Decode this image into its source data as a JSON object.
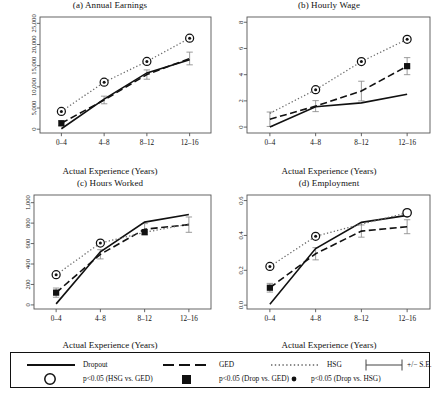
{
  "figure": {
    "xlabel": "Actual Experience (Years)",
    "xticks": [
      "0–4",
      "4–8",
      "8–12",
      "12–16"
    ]
  },
  "legend": {
    "dropout_label": "Dropout",
    "ged_label": "GED",
    "hsg_label": "HSG",
    "se_label": "+/− S.E.",
    "sig_hsg_ged": "p<0.05 (HSG vs. GED)",
    "sig_drop_ged": "p<0.05 (Drop vs. GED)",
    "sig_drop_hsg": "p<0.05 (Drop vs. HSG)",
    "keys": {
      "dropout": "solid-line-key",
      "ged": "dashed-line-key",
      "hsg": "dotted-line-key",
      "se": "errorbar-key",
      "open_circle": "open-circle-marker",
      "filled_square": "filled-square-marker",
      "small_dot": "small-dot-marker"
    }
  },
  "colors": {
    "line": "#111111",
    "axis": "#555555",
    "errorbar": "#777777",
    "background": "#ffffff"
  },
  "chart_data": [
    {
      "type": "line",
      "panel": "a",
      "title": "(a) Annual Earnings",
      "xlabel": "Actual Experience (Years)",
      "ylabel": "",
      "categories": [
        "0–4",
        "4–8",
        "8–12",
        "12–16"
      ],
      "yticks": [
        0,
        5000,
        10000,
        15000,
        20000,
        25000
      ],
      "yticklabels": [
        "0",
        "5,000",
        "10,000",
        "15,000",
        "20,000",
        "25,000"
      ],
      "ylim": [
        -900,
        26500
      ],
      "grid": false,
      "legend_position": "below-figure",
      "series": [
        {
          "name": "Dropout",
          "style": "solid",
          "values": [
            100,
            7100,
            13300,
            16400
          ],
          "errors": [
            0,
            0,
            0,
            0
          ]
        },
        {
          "name": "GED",
          "style": "dashed",
          "values": [
            1400,
            6900,
            12900,
            16700
          ],
          "errors": [
            600,
            900,
            1100,
            1500
          ]
        },
        {
          "name": "HSG",
          "style": "dotted",
          "values": [
            4200,
            11100,
            16000,
            21500
          ],
          "errors": [
            0,
            0,
            0,
            0
          ]
        }
      ],
      "markers": [
        {
          "x": "0–4",
          "y": 4200,
          "type": "open_circle_with_dot"
        },
        {
          "x": "4–8",
          "y": 11100,
          "type": "open_circle_with_dot"
        },
        {
          "x": "8–12",
          "y": 16000,
          "type": "open_circle_with_dot"
        },
        {
          "x": "12–16",
          "y": 21500,
          "type": "open_circle_with_dot"
        },
        {
          "x": "0–4",
          "y": 1400,
          "type": "filled_square"
        }
      ]
    },
    {
      "type": "line",
      "panel": "b",
      "title": "(b) Hourly Wage",
      "xlabel": "Actual Experience (Years)",
      "ylabel": "",
      "categories": [
        "0–4",
        "4–8",
        "8–12",
        "12–16"
      ],
      "yticks": [
        0,
        2,
        4,
        6,
        8
      ],
      "yticklabels": [
        "0",
        "2",
        "4",
        "6",
        "8"
      ],
      "ylim": [
        -0.45,
        8.4
      ],
      "grid": false,
      "legend_position": "below-figure",
      "series": [
        {
          "name": "Dropout",
          "style": "solid",
          "values": [
            0.0,
            1.55,
            1.85,
            2.5
          ],
          "errors": [
            0,
            0,
            0,
            0
          ]
        },
        {
          "name": "GED",
          "style": "dashed",
          "values": [
            0.6,
            1.6,
            2.75,
            4.65
          ],
          "errors": [
            0.55,
            0.42,
            0.75,
            0.65
          ]
        },
        {
          "name": "HSG",
          "style": "dotted",
          "values": [
            1.05,
            2.85,
            5.0,
            6.7
          ],
          "errors": [
            0,
            0,
            0,
            0
          ]
        }
      ],
      "markers": [
        {
          "x": "4–8",
          "y": 2.85,
          "type": "open_circle_with_dot"
        },
        {
          "x": "8–12",
          "y": 5.0,
          "type": "open_circle_with_dot"
        },
        {
          "x": "12–16",
          "y": 6.7,
          "type": "open_circle_with_dot"
        },
        {
          "x": "12–16",
          "y": 4.65,
          "type": "filled_square"
        }
      ]
    },
    {
      "type": "line",
      "panel": "c",
      "title": "(c) Hours Worked",
      "xlabel": "Actual Experience (Years)",
      "ylabel": "",
      "categories": [
        "0–4",
        "4–8",
        "8–12",
        "12–16"
      ],
      "yticks": [
        0,
        200,
        400,
        600,
        800,
        1000
      ],
      "yticklabels": [
        "0",
        "200",
        "400",
        "600",
        "800",
        "1,000"
      ],
      "ylim": [
        -40,
        1075
      ],
      "grid": false,
      "legend_position": "below-figure",
      "series": [
        {
          "name": "Dropout",
          "style": "solid",
          "values": [
            10,
            520,
            810,
            885
          ],
          "errors": [
            0,
            0,
            0,
            0
          ]
        },
        {
          "name": "GED",
          "style": "dashed",
          "values": [
            120,
            495,
            740,
            785
          ],
          "errors": [
            45,
            45,
            55,
            75
          ]
        },
        {
          "name": "HSG",
          "style": "dotted",
          "values": [
            295,
            605,
            710,
            790
          ],
          "errors": [
            0,
            0,
            0,
            0
          ]
        }
      ],
      "markers": [
        {
          "x": "0–4",
          "y": 295,
          "type": "open_circle_with_dot"
        },
        {
          "x": "4–8",
          "y": 605,
          "type": "open_circle_with_dot"
        },
        {
          "x": "0–4",
          "y": 120,
          "type": "filled_square"
        },
        {
          "x": "8–12",
          "y": 712,
          "type": "filled_square"
        }
      ]
    },
    {
      "type": "line",
      "panel": "d",
      "title": "(d) Employment",
      "xlabel": "Actual Experience (Years)",
      "ylabel": "",
      "categories": [
        "0–4",
        "4–8",
        "8–12",
        "12–16"
      ],
      "yticks": [
        0.0,
        0.2,
        0.4,
        0.6
      ],
      "yticklabels": [
        "0.0",
        "0.2",
        "0.4",
        "0.6"
      ],
      "ylim": [
        -0.022,
        0.632
      ],
      "grid": false,
      "legend_position": "below-figure",
      "series": [
        {
          "name": "Dropout",
          "style": "solid",
          "values": [
            0.005,
            0.325,
            0.475,
            0.515
          ],
          "errors": [
            0,
            0,
            0,
            0
          ]
        },
        {
          "name": "GED",
          "style": "dashed",
          "values": [
            0.1,
            0.295,
            0.425,
            0.45
          ],
          "errors": [
            0.025,
            0.035,
            0.035,
            0.04
          ]
        },
        {
          "name": "HSG",
          "style": "dotted",
          "values": [
            0.222,
            0.395,
            0.465,
            0.53
          ],
          "errors": [
            0,
            0,
            0,
            0
          ]
        }
      ],
      "markers": [
        {
          "x": "0–4",
          "y": 0.222,
          "type": "open_circle_with_dot"
        },
        {
          "x": "4–8",
          "y": 0.395,
          "type": "open_circle_with_dot"
        },
        {
          "x": "0–4",
          "y": 0.1,
          "type": "filled_square"
        },
        {
          "x": "12–16",
          "y": 0.53,
          "type": "open_circle"
        }
      ]
    }
  ]
}
